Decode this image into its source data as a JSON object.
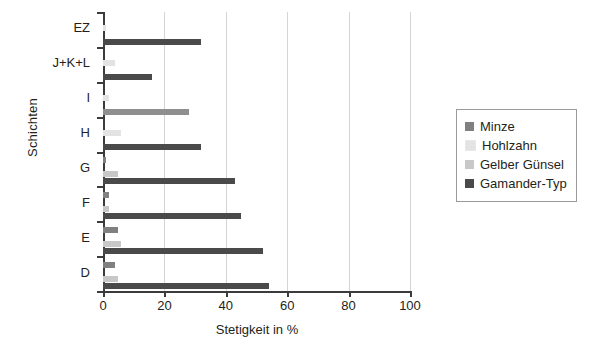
{
  "chart_data": {
    "type": "bar",
    "orientation": "horizontal",
    "title": "",
    "xlabel": "Stetigkeit in %",
    "ylabel": "Schichten",
    "categories": [
      "EZ",
      "J+K+L",
      "I",
      "H",
      "G",
      "F",
      "E",
      "D"
    ],
    "xticks": [
      "0",
      "20",
      "40",
      "60",
      "80",
      "100"
    ],
    "xlim": [
      0,
      100
    ],
    "grid": "vertical",
    "legend_position": "right",
    "series": [
      {
        "name": "Minze",
        "color": "#808080",
        "values": [
          0,
          0,
          0,
          0,
          1,
          2,
          5,
          4
        ]
      },
      {
        "name": "Hohlzahn",
        "color": "#e3e3e3",
        "values": [
          1,
          4,
          2,
          6,
          0,
          0,
          0,
          0
        ]
      },
      {
        "name": "Gelber Günsel",
        "color": "#c8c8c8",
        "values": [
          0,
          0,
          0,
          0,
          5,
          2,
          6,
          5
        ]
      },
      {
        "name": "Gamander-Typ",
        "color": "#4a4a4a",
        "values": [
          32,
          16,
          28,
          32,
          43,
          45,
          52,
          54
        ]
      }
    ],
    "series_shades_note": {
      "I_gamander_shade": "#8f8f8f"
    }
  },
  "legend": {
    "items": [
      {
        "label": "Minze",
        "color": "#808080"
      },
      {
        "label": "Hohlzahn",
        "color": "#e3e3e3"
      },
      {
        "label": "Gelber Günsel",
        "color": "#c8c8c8"
      },
      {
        "label": "Gamander-Typ",
        "color": "#4a4a4a"
      }
    ]
  }
}
